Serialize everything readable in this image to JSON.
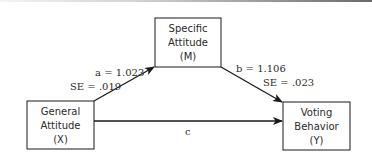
{
  "diagram": {
    "type": "mediation-model",
    "nodes": {
      "mediator": {
        "lines": [
          "Specific",
          "Attitude",
          "(M)"
        ]
      },
      "predictor": {
        "lines": [
          "General",
          "Attitude",
          "(X)"
        ]
      },
      "outcome": {
        "lines": [
          "Voting",
          "Behavior",
          "(Y)"
        ]
      }
    },
    "paths": {
      "a": {
        "label": "a = 1.023",
        "se": "SE = .019"
      },
      "b": {
        "label": "b = 1.106",
        "se": "SE = .023"
      },
      "c": {
        "label": "c"
      }
    }
  }
}
